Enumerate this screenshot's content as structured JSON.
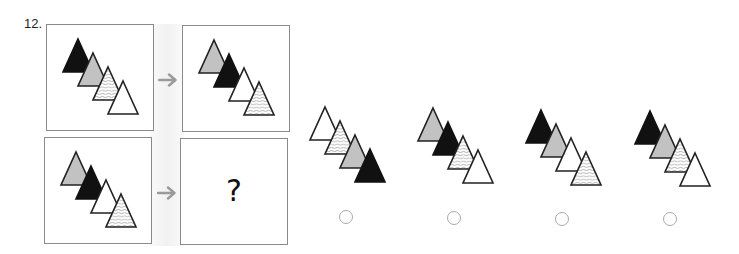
{
  "question": {
    "number": "12.",
    "missing_label": "?"
  },
  "colors": {
    "black": "#111111",
    "gray": "#c2c2c2",
    "white": "#ffffff",
    "outline": "#222222",
    "arrow": "#9a9a9a",
    "radio_border": "#a9a9a9"
  },
  "panels": [
    {
      "id": "example-input",
      "sequence": [
        "black",
        "gray",
        "hatched",
        "white"
      ]
    },
    {
      "id": "example-output",
      "sequence": [
        "gray",
        "black",
        "white",
        "hatched"
      ]
    },
    {
      "id": "query-input",
      "sequence": [
        "gray",
        "black",
        "white",
        "hatched"
      ]
    },
    {
      "id": "query-output",
      "sequence": []
    }
  ],
  "options": [
    {
      "id": "A",
      "sequence": [
        "white",
        "hatched",
        "gray",
        "black"
      ],
      "selected": false
    },
    {
      "id": "B",
      "sequence": [
        "gray",
        "black",
        "hatched",
        "white"
      ],
      "selected": false
    },
    {
      "id": "C",
      "sequence": [
        "black",
        "gray",
        "white",
        "hatched"
      ],
      "selected": false
    },
    {
      "id": "D",
      "sequence": [
        "black",
        "gray",
        "hatched",
        "white"
      ],
      "selected": false
    }
  ],
  "icons": {
    "arrow": "right-arrow-icon",
    "radio": "radio-button-icon"
  }
}
